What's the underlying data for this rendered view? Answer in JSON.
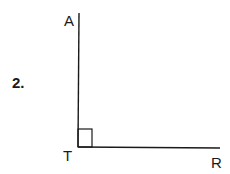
{
  "problem": {
    "number": "2.",
    "points": {
      "A": {
        "label": "A",
        "x": 79,
        "y": 13
      },
      "T": {
        "label": "T",
        "x": 78,
        "y": 147
      },
      "R": {
        "label": "R",
        "x": 220,
        "y": 148
      }
    },
    "right_angle_at": "T",
    "stroke_color": "#1a1a1a"
  }
}
